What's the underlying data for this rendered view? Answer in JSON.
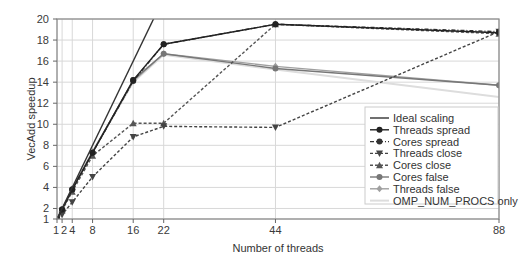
{
  "chart_data": {
    "type": "line",
    "title": "",
    "xlabel": "Number of threads",
    "ylabel": "VecAdd speedup",
    "xlim": [
      1,
      88
    ],
    "ylim": [
      1,
      20
    ],
    "x_ticks": [
      1,
      2,
      4,
      8,
      16,
      22,
      44,
      88
    ],
    "x_tick_labels": [
      "1",
      "2",
      "4",
      "8",
      "16",
      "22",
      "44",
      "88"
    ],
    "y_ticks": [
      1,
      2,
      4,
      6,
      8,
      10,
      12,
      14,
      16,
      18,
      20
    ],
    "grid": true,
    "legend_position": "lower right",
    "x": [
      1,
      2,
      4,
      8,
      16,
      22,
      44,
      88
    ],
    "series": [
      {
        "name": "Ideal scaling",
        "style": "solid",
        "marker": "none",
        "color": "#333333",
        "x": [
          1,
          20
        ],
        "values": [
          1,
          20
        ]
      },
      {
        "name": "Threads spread",
        "style": "solid",
        "marker": "circle",
        "color": "#222222",
        "values": [
          1.0,
          1.9,
          3.8,
          7.3,
          14.2,
          17.6,
          19.5,
          18.7
        ]
      },
      {
        "name": "Cores spread",
        "style": "dashdot",
        "marker": "circle",
        "color": "#333333",
        "values": [
          1.0,
          1.9,
          3.8,
          7.3,
          14.1,
          17.6,
          19.5,
          18.8
        ]
      },
      {
        "name": "Threads close",
        "style": "dashed",
        "marker": "triangle-down",
        "color": "#444444",
        "values": [
          1.0,
          1.4,
          2.6,
          5.0,
          8.8,
          9.8,
          9.7,
          18.8
        ]
      },
      {
        "name": "Cores close",
        "style": "dashed",
        "marker": "triangle-up",
        "color": "#555555",
        "values": [
          1.0,
          1.8,
          3.6,
          7.0,
          10.1,
          10.1,
          19.5,
          18.6
        ]
      },
      {
        "name": "Cores false",
        "style": "solid",
        "marker": "circle",
        "color": "#777777",
        "values": [
          1.0,
          1.9,
          3.8,
          7.3,
          14.2,
          16.7,
          15.3,
          13.7
        ]
      },
      {
        "name": "Threads false",
        "style": "solid",
        "marker": "diamond",
        "color": "#a0a0a0",
        "values": [
          1.0,
          1.9,
          3.9,
          7.4,
          14.1,
          16.7,
          15.5,
          13.7
        ]
      },
      {
        "name": "OMP_NUM_PROCS only",
        "style": "solid",
        "marker": "none",
        "color": "#dddddd",
        "values": [
          1.0,
          2.0,
          3.9,
          7.4,
          14.0,
          16.6,
          15.2,
          12.6
        ]
      }
    ]
  },
  "axes": {
    "xlabel": "Number of threads",
    "ylabel": "VecAdd speedup"
  },
  "legend": {
    "items": [
      "Ideal scaling",
      "Threads spread",
      "Cores spread",
      "Threads close",
      "Cores close",
      "Cores false",
      "Threads false",
      "OMP_NUM_PROCS only"
    ]
  }
}
